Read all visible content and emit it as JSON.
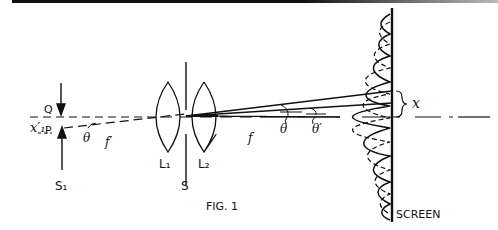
{
  "figure": {
    "caption": "FIG. 1",
    "type": "optics-interference-setup"
  },
  "labels": {
    "x_prime_1": "x′₁",
    "point_q": "Q",
    "point_p": "P",
    "source_s1": "S₁",
    "theta": "θ",
    "f_prime": "f′",
    "lens_l1": "L₁",
    "lens_l2": "L₂",
    "slit_s": "S",
    "focal_f": "f",
    "theta_2": "θ",
    "theta_prime": "θ′",
    "fringe_x": "x",
    "screen": "SCREEN"
  },
  "colors": {
    "ink": "#111111",
    "background": "#ffffff"
  }
}
